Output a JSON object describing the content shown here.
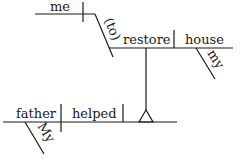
{
  "diagram": {
    "type": "sentence-diagram",
    "sentence": "My father helped me (to) restore my house",
    "words": {
      "subject": "father",
      "subject_modifier": "My",
      "verb": "helped",
      "indirect_object": "me",
      "infinitive_marker": "(to)",
      "infinitive_verb": "restore",
      "infinitive_object": "house",
      "object_modifier": "my"
    },
    "line_color": "#1a1a1a"
  }
}
